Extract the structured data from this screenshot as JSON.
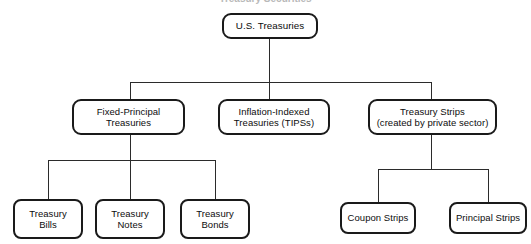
{
  "diagram": {
    "title_partial": "Treasury Securities",
    "background_color": "#ffffff",
    "node_border_color": "#1a1a1a",
    "connector_color": "#2b2b2b",
    "text_color": "#0d0d0d",
    "nodes": {
      "root": {
        "label": "U.S. Treasuries"
      },
      "level2": [
        {
          "label": "Fixed-Principal\nTreasuries"
        },
        {
          "label": "Inflation-Indexed\nTreasuries (TIPSs)"
        },
        {
          "label": "Treasury Strips\n(created by private sector)"
        }
      ],
      "level3_left": [
        {
          "label": "Treasury\nBills"
        },
        {
          "label": "Treasury\nNotes"
        },
        {
          "label": "Treasury\nBonds"
        }
      ],
      "level3_right": [
        {
          "label": "Coupon Strips"
        },
        {
          "label": "Principal Strips"
        }
      ]
    }
  }
}
